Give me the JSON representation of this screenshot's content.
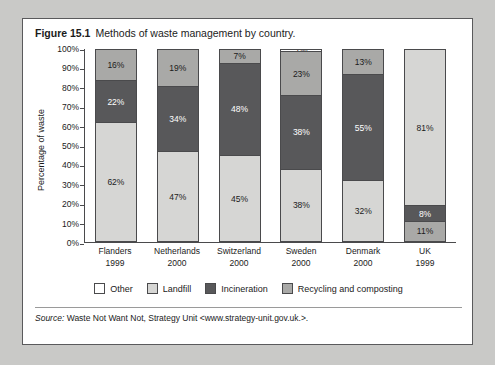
{
  "figure": {
    "number": "Figure 15.1",
    "title": "Methods of waste management by country."
  },
  "source": {
    "label": "Source:",
    "text": "Waste Not Want Not, Strategy Unit <www.strategy-unit.gov.uk.>."
  },
  "axes": {
    "y_title": "Percentage of waste",
    "y_ticks": [
      "100%",
      "90%",
      "80%",
      "70%",
      "60%",
      "50%",
      "40%",
      "30%",
      "20%",
      "10%",
      "0%"
    ]
  },
  "legend": {
    "items": [
      {
        "label": "Other",
        "key": "other",
        "color": "#ffffff"
      },
      {
        "label": "Landfill",
        "key": "landfill",
        "color": "#d6d6d4"
      },
      {
        "label": "Incineration",
        "key": "incineration",
        "color": "#58585a"
      },
      {
        "label": "Recycling and composting",
        "key": "recycling",
        "color": "#a9a9a7"
      }
    ]
  },
  "categories": [
    {
      "name": "Flanders",
      "year": "1999"
    },
    {
      "name": "Netherlands",
      "year": "2000"
    },
    {
      "name": "Switzerland",
      "year": "2000"
    },
    {
      "name": "Sweden",
      "year": "2000"
    },
    {
      "name": "Denmark",
      "year": "2000"
    },
    {
      "name": "UK",
      "year": "1999"
    }
  ],
  "chart_data": {
    "type": "bar",
    "title": "Methods of waste management by country.",
    "xlabel": "",
    "ylabel": "Percentage of waste",
    "ylim": [
      0,
      100
    ],
    "stacked": true,
    "grid": false,
    "legend_position": "bottom",
    "categories": [
      "Flanders 1999",
      "Netherlands 2000",
      "Switzerland 2000",
      "Sweden 2000",
      "Denmark 2000",
      "UK 1999"
    ],
    "series": [
      {
        "name": "Landfill",
        "values": [
          62,
          47,
          45,
          38,
          32,
          81
        ]
      },
      {
        "name": "Incineration",
        "values": [
          22,
          34,
          48,
          38,
          55,
          8
        ]
      },
      {
        "name": "Recycling and composting",
        "values": [
          16,
          19,
          7,
          23,
          13,
          11
        ]
      },
      {
        "name": "Other",
        "values": [
          0,
          0,
          0,
          1,
          0,
          0
        ]
      }
    ],
    "bars": [
      {
        "category": "Flanders 1999",
        "segments": [
          {
            "key": "recycling",
            "label": "16%",
            "value": 16
          },
          {
            "key": "incineration",
            "label": "22%",
            "value": 22
          },
          {
            "key": "landfill",
            "label": "62%",
            "value": 62
          }
        ]
      },
      {
        "category": "Netherlands 2000",
        "segments": [
          {
            "key": "recycling",
            "label": "19%",
            "value": 19
          },
          {
            "key": "incineration",
            "label": "34%",
            "value": 34
          },
          {
            "key": "landfill",
            "label": "47%",
            "value": 47
          }
        ]
      },
      {
        "category": "Switzerland 2000",
        "segments": [
          {
            "key": "recycling",
            "label": "7%",
            "value": 7
          },
          {
            "key": "incineration",
            "label": "48%",
            "value": 48
          },
          {
            "key": "landfill",
            "label": "45%",
            "value": 45
          }
        ]
      },
      {
        "category": "Sweden 2000",
        "segments": [
          {
            "key": "other",
            "label": "1%",
            "value": 1
          },
          {
            "key": "recycling",
            "label": "23%",
            "value": 23
          },
          {
            "key": "incineration",
            "label": "38%",
            "value": 38
          },
          {
            "key": "landfill",
            "label": "38%",
            "value": 38
          }
        ]
      },
      {
        "category": "Denmark 2000",
        "segments": [
          {
            "key": "recycling",
            "label": "13%",
            "value": 13
          },
          {
            "key": "incineration",
            "label": "55%",
            "value": 55
          },
          {
            "key": "landfill",
            "label": "32%",
            "value": 32
          }
        ]
      },
      {
        "category": "UK 1999",
        "segments": [
          {
            "key": "landfill",
            "label": "81%",
            "value": 81
          },
          {
            "key": "incineration",
            "label": "8%",
            "value": 8
          },
          {
            "key": "recycling",
            "label": "11%",
            "value": 11
          }
        ]
      }
    ]
  }
}
